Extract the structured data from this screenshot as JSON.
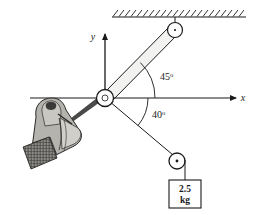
{
  "figure": {
    "title": "",
    "type": "mechanics-free-body-diagram",
    "axes": {
      "x_label": "x",
      "y_label": "y"
    },
    "angles": [
      {
        "value": "45",
        "unit": "o",
        "name": "bar-angle-above-x-axis"
      },
      {
        "value": "40",
        "unit": "o",
        "name": "cord-angle-below-x-axis"
      }
    ],
    "load": {
      "mass_value": "2.5",
      "mass_unit": "kg"
    },
    "parts": {
      "ceiling": "hatched-fixed-support",
      "top_pin": "pin-joint",
      "bar": "rigid-link",
      "hub": "ankle-joint-hub",
      "lower_pulley": "pulley",
      "weight_box": "hanging-mass-block",
      "limb": "foot-in-sock"
    },
    "colors": {
      "stroke": "#1a1a1a",
      "background": "#ffffff",
      "limb_fill": "#b5b3ae",
      "limb_fill_light": "#d6d4cf",
      "metal_fill": "#e8e8e6"
    }
  }
}
